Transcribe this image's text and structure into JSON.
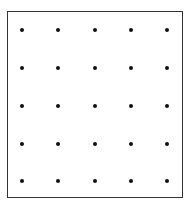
{
  "diagram": {
    "type": "dot-grid",
    "rows": 5,
    "cols": 5,
    "dot_color": "#111111",
    "border_color": "#333333",
    "col_x": [
      22,
      58,
      95,
      131,
      167
    ],
    "row_y": [
      30,
      68,
      106,
      144,
      181
    ]
  }
}
